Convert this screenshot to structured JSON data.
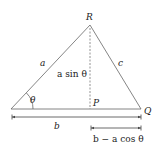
{
  "diagram": {
    "type": "triangle-law-of-cosines",
    "vertices": {
      "R": "R",
      "P": "P",
      "Q": "Q"
    },
    "sides": {
      "a": "a",
      "c": "c",
      "b": "b"
    },
    "angle": "θ",
    "height_label": "a sin θ",
    "segment_label": "b − a cos θ",
    "colors": {
      "line": "#555555",
      "text": "#222222"
    }
  }
}
